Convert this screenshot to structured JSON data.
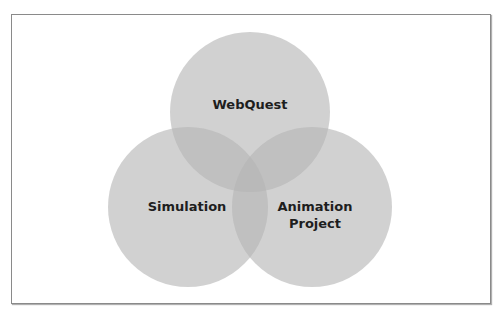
{
  "diagram": {
    "type": "venn",
    "circle_fill": "#bdbdbd",
    "circle_opacity": 0.6,
    "circles": [
      {
        "label": "WebQuest",
        "lines": [
          "WebQuest"
        ],
        "cx": 250,
        "cy": 112,
        "r": 80
      },
      {
        "label": "Simulation",
        "lines": [
          "Simulation"
        ],
        "cx": 188,
        "cy": 207,
        "r": 80
      },
      {
        "label": "Animation Project",
        "lines": [
          "Animation",
          "Project"
        ],
        "cx": 312,
        "cy": 207,
        "r": 80
      }
    ]
  }
}
